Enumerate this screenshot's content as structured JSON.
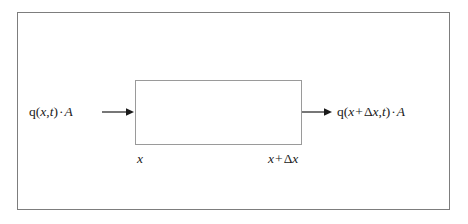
{
  "figure": {
    "colors": {
      "frame_stroke": "#7d7d7d",
      "box_stroke": "#9a9a9a",
      "text": "#1b1b1b",
      "arrow": "#1b1b1b",
      "background": "#ffffff"
    }
  },
  "control_volume": {
    "name": "control-volume-box"
  },
  "inflow": {
    "arrow_icon": "arrow-right-icon",
    "label_full": "q(x,t) · A",
    "parts": {
      "q": "q",
      "open_paren": "(",
      "x": "x",
      "comma": ",",
      "t": "t",
      "close_paren": ")",
      "dot": "·",
      "area": "A"
    }
  },
  "outflow": {
    "arrow_icon": "arrow-right-icon",
    "label_full": "q(x + Δx, t) · A",
    "parts": {
      "q": "q",
      "open_paren": "(",
      "x": "x",
      "plus": "+",
      "delta": "Δ",
      "delta_x": "x",
      "comma": ",",
      "t": "t",
      "close_paren": ")",
      "dot": "·",
      "area": "A"
    }
  },
  "axis_labels": {
    "left_full": "x",
    "left": {
      "x": "x"
    },
    "right_full": "x + Δx",
    "right": {
      "x": "x",
      "plus": "+",
      "delta": "Δ",
      "delta_x": "x"
    }
  }
}
